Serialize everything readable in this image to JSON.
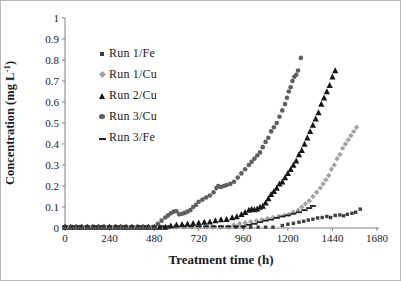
{
  "frame": {
    "background": "#ffffff",
    "border_color": "#b9b9b9",
    "axis_color": "#808080",
    "text_color": "#1a1a1a"
  },
  "chart_data": {
    "type": "scatter",
    "title": "",
    "xlabel": "Treatment time (h)",
    "ylabel": "Concentration (mg L-1)",
    "ylabel_parts": {
      "base": "Concentration (mg L",
      "sup": "-1",
      "close": ")"
    },
    "xlim": [
      0,
      1680
    ],
    "ylim": [
      0,
      1
    ],
    "x_ticks": [
      {
        "v": 0,
        "label": "0"
      },
      {
        "v": 240,
        "label": "240"
      },
      {
        "v": 480,
        "label": "480"
      },
      {
        "v": 720,
        "label": "720"
      },
      {
        "v": 960,
        "label": "960"
      },
      {
        "v": 1200,
        "label": "1200"
      },
      {
        "v": 1440,
        "label": "1440"
      },
      {
        "v": 1680,
        "label": "1680"
      }
    ],
    "y_ticks": [
      {
        "v": 0,
        "label": "0"
      },
      {
        "v": 0.1,
        "label": "0.1"
      },
      {
        "v": 0.2,
        "label": "0.2"
      },
      {
        "v": 0.3,
        "label": "0.3"
      },
      {
        "v": 0.4,
        "label": "0.4"
      },
      {
        "v": 0.5,
        "label": "0.5"
      },
      {
        "v": 0.6,
        "label": "0.6"
      },
      {
        "v": 0.7,
        "label": "0.7"
      },
      {
        "v": 0.8,
        "label": "0.8"
      },
      {
        "v": 0.9,
        "label": "0.9"
      },
      {
        "v": 1,
        "label": "1"
      }
    ],
    "grid": false,
    "legend_position": "upper-left-inside",
    "series": [
      {
        "name": "Run 1/Fe",
        "marker": "square",
        "color": "#3f3f3f",
        "flat": [
          0,
          1140,
          40,
          0.004
        ],
        "points": [
          [
            1170,
            0.012
          ],
          [
            1200,
            0.018
          ],
          [
            1230,
            0.022
          ],
          [
            1260,
            0.028
          ],
          [
            1285,
            0.032
          ],
          [
            1310,
            0.038
          ],
          [
            1335,
            0.042
          ],
          [
            1360,
            0.048
          ],
          [
            1385,
            0.05
          ],
          [
            1410,
            0.055
          ],
          [
            1430,
            0.05
          ],
          [
            1455,
            0.06
          ],
          [
            1480,
            0.062
          ],
          [
            1500,
            0.058
          ],
          [
            1520,
            0.065
          ],
          [
            1545,
            0.07
          ],
          [
            1565,
            0.075
          ],
          [
            1590,
            0.09
          ]
        ]
      },
      {
        "name": "Run 1/Cu",
        "marker": "diamond",
        "color": "#a3a3a3",
        "flat": [
          0,
          880,
          40,
          0.005
        ],
        "points": [
          [
            910,
            0.015
          ],
          [
            940,
            0.02
          ],
          [
            970,
            0.025
          ],
          [
            1000,
            0.03
          ],
          [
            1030,
            0.035
          ],
          [
            1060,
            0.04
          ],
          [
            1090,
            0.045
          ],
          [
            1120,
            0.05
          ],
          [
            1150,
            0.055
          ],
          [
            1180,
            0.06
          ],
          [
            1205,
            0.065
          ],
          [
            1230,
            0.075
          ],
          [
            1255,
            0.085
          ],
          [
            1275,
            0.1
          ],
          [
            1295,
            0.115
          ],
          [
            1315,
            0.13
          ],
          [
            1335,
            0.15
          ],
          [
            1355,
            0.17
          ],
          [
            1375,
            0.19
          ],
          [
            1390,
            0.21
          ],
          [
            1405,
            0.23
          ],
          [
            1420,
            0.25
          ],
          [
            1435,
            0.28
          ],
          [
            1450,
            0.3
          ],
          [
            1465,
            0.33
          ],
          [
            1480,
            0.35
          ],
          [
            1495,
            0.38
          ],
          [
            1510,
            0.4
          ],
          [
            1525,
            0.42
          ],
          [
            1540,
            0.44
          ],
          [
            1555,
            0.46
          ],
          [
            1570,
            0.48
          ]
        ]
      },
      {
        "name": "Run 2/Cu",
        "marker": "triangle",
        "color": "#161616",
        "flat": [
          0,
          540,
          30,
          0.005
        ],
        "points": [
          [
            570,
            0.01
          ],
          [
            600,
            0.015
          ],
          [
            630,
            0.018
          ],
          [
            660,
            0.02
          ],
          [
            690,
            0.022
          ],
          [
            720,
            0.025
          ],
          [
            750,
            0.028
          ],
          [
            780,
            0.03
          ],
          [
            810,
            0.035
          ],
          [
            840,
            0.04
          ],
          [
            870,
            0.042
          ],
          [
            900,
            0.05
          ],
          [
            925,
            0.055
          ],
          [
            950,
            0.065
          ],
          [
            970,
            0.075
          ],
          [
            990,
            0.085
          ],
          [
            1005,
            0.09
          ],
          [
            1020,
            0.088
          ],
          [
            1035,
            0.092
          ],
          [
            1050,
            0.1
          ],
          [
            1065,
            0.105
          ],
          [
            1080,
            0.12
          ],
          [
            1095,
            0.14
          ],
          [
            1110,
            0.16
          ],
          [
            1125,
            0.175
          ],
          [
            1140,
            0.19
          ],
          [
            1155,
            0.21
          ],
          [
            1170,
            0.22
          ],
          [
            1185,
            0.24
          ],
          [
            1200,
            0.26
          ],
          [
            1215,
            0.28
          ],
          [
            1230,
            0.3
          ],
          [
            1245,
            0.32
          ],
          [
            1260,
            0.35
          ],
          [
            1275,
            0.37
          ],
          [
            1290,
            0.4
          ],
          [
            1305,
            0.43
          ],
          [
            1320,
            0.46
          ],
          [
            1335,
            0.49
          ],
          [
            1350,
            0.52
          ],
          [
            1365,
            0.55
          ],
          [
            1380,
            0.59
          ],
          [
            1395,
            0.62
          ],
          [
            1410,
            0.65
          ],
          [
            1425,
            0.68
          ],
          [
            1440,
            0.72
          ],
          [
            1455,
            0.75
          ]
        ]
      },
      {
        "name": "Run 3/Cu",
        "marker": "circle",
        "color": "#5f5f5f",
        "flat": [
          0,
          480,
          30,
          0.006
        ],
        "points": [
          [
            500,
            0.02
          ],
          [
            520,
            0.035
          ],
          [
            540,
            0.05
          ],
          [
            555,
            0.06
          ],
          [
            570,
            0.07
          ],
          [
            585,
            0.078
          ],
          [
            600,
            0.08
          ],
          [
            615,
            0.065
          ],
          [
            630,
            0.068
          ],
          [
            645,
            0.072
          ],
          [
            660,
            0.078
          ],
          [
            675,
            0.085
          ],
          [
            690,
            0.1
          ],
          [
            705,
            0.11
          ],
          [
            720,
            0.125
          ],
          [
            740,
            0.135
          ],
          [
            760,
            0.145
          ],
          [
            780,
            0.155
          ],
          [
            800,
            0.17
          ],
          [
            815,
            0.19
          ],
          [
            825,
            0.2
          ],
          [
            840,
            0.195
          ],
          [
            855,
            0.2
          ],
          [
            870,
            0.205
          ],
          [
            890,
            0.21
          ],
          [
            910,
            0.22
          ],
          [
            930,
            0.24
          ],
          [
            950,
            0.26
          ],
          [
            970,
            0.28
          ],
          [
            990,
            0.3
          ],
          [
            1005,
            0.315
          ],
          [
            1020,
            0.33
          ],
          [
            1035,
            0.345
          ],
          [
            1050,
            0.36
          ],
          [
            1065,
            0.385
          ],
          [
            1080,
            0.41
          ],
          [
            1095,
            0.43
          ],
          [
            1110,
            0.46
          ],
          [
            1125,
            0.48
          ],
          [
            1140,
            0.5
          ],
          [
            1155,
            0.53
          ],
          [
            1170,
            0.56
          ],
          [
            1185,
            0.59
          ],
          [
            1195,
            0.62
          ],
          [
            1205,
            0.65
          ],
          [
            1215,
            0.67
          ],
          [
            1225,
            0.7
          ],
          [
            1235,
            0.72
          ],
          [
            1245,
            0.73
          ],
          [
            1255,
            0.75
          ],
          [
            1270,
            0.81
          ]
        ]
      },
      {
        "name": "Run 3/Fe",
        "marker": "dash",
        "color": "#1f1f1f",
        "flat": [
          0,
          960,
          40,
          0.008
        ],
        "points": [
          [
            990,
            0.015
          ],
          [
            1020,
            0.02
          ],
          [
            1050,
            0.028
          ],
          [
            1080,
            0.035
          ],
          [
            1110,
            0.04
          ],
          [
            1140,
            0.048
          ],
          [
            1170,
            0.055
          ],
          [
            1200,
            0.06
          ],
          [
            1230,
            0.068
          ],
          [
            1260,
            0.075
          ],
          [
            1290,
            0.085
          ],
          [
            1315,
            0.095
          ],
          [
            1335,
            0.105
          ]
        ]
      }
    ]
  }
}
